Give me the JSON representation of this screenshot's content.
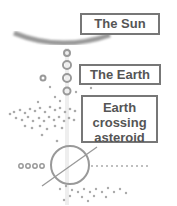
{
  "labels": {
    "sun": "The Sun",
    "earth": "The Earth",
    "asteroid_line1": "Earth",
    "asteroid_line2": "crossing",
    "asteroid_line3": "asteroid"
  },
  "colors": {
    "stroke": "#888888",
    "text": "#555555",
    "border": "#777777"
  }
}
